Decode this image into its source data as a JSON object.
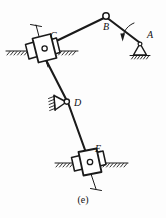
{
  "figure": {
    "caption": "(e)",
    "background_color": "#fdfdfd",
    "ink_color": "#1a1a1a",
    "width": 166,
    "height": 218
  },
  "labels": {
    "a": "A",
    "b": "B",
    "c": "C",
    "d": "D",
    "e": "E"
  },
  "joints": [
    {
      "id": "A",
      "label": "A",
      "kind": "fixed-pivot-triangle-support",
      "x": 140,
      "y": 44,
      "label_x": 147,
      "label_y": 38,
      "interactable": false
    },
    {
      "id": "B",
      "label": "B",
      "kind": "pin-joint-circle",
      "x": 106,
      "y": 16,
      "label_x": 106,
      "label_y": 29,
      "interactable": false
    },
    {
      "id": "C",
      "label": "C",
      "kind": "slider-block-on-inclined-guide",
      "x": 43,
      "y": 51,
      "label_x": 50,
      "label_y": 39,
      "interactable": false
    },
    {
      "id": "D",
      "label": "D",
      "kind": "fixed-pivot-triangle-support",
      "x": 67,
      "y": 102,
      "label_x": 75,
      "label_y": 104,
      "interactable": false
    },
    {
      "id": "E",
      "label": "E",
      "kind": "slider-block-on-horizontal-guide",
      "x": 89,
      "y": 163,
      "label_x": 96,
      "label_y": 152,
      "interactable": false
    }
  ],
  "links": [
    {
      "id": "AB",
      "from": "A",
      "to": "B",
      "note": "crank link from fixed pivot A to pin B"
    },
    {
      "id": "BC",
      "from": "B",
      "to": "C",
      "note": "coupler link from pin B to slider C"
    },
    {
      "id": "CD",
      "from": "C",
      "to": "D",
      "note": "link from slider C through pivot D"
    },
    {
      "id": "DE",
      "from": "D",
      "to": "E",
      "note": "link from pivot D to slider E"
    }
  ],
  "annotations": {
    "rotation_arrow": {
      "name": "rotation-direction-arrow",
      "note": "curved arrow near link A-B indicating direction of crank rotation"
    },
    "ground_lines": [
      {
        "name": "ground-line-c",
        "orientation": "horizontal",
        "y": 51
      },
      {
        "name": "ground-line-e",
        "orientation": "horizontal",
        "y": 163
      },
      {
        "name": "ground-line-a",
        "orientation": "horizontal",
        "y": 55
      },
      {
        "name": "ground-line-d",
        "orientation": "inclined",
        "note": "hatched face left of pivot D"
      }
    ],
    "guide_rods": [
      {
        "name": "guide-rod-c",
        "note": "rod with T terminal above-left of slider C"
      },
      {
        "name": "guide-rod-e",
        "note": "rod with T terminal below slider E"
      }
    ]
  }
}
